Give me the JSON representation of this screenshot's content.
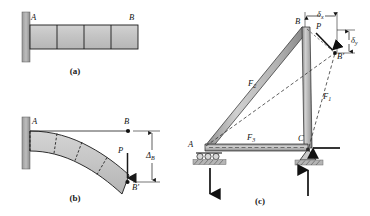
{
  "figure": {
    "panels": [
      {
        "id": "a",
        "caption": "(a)",
        "description": "undeformed-cantilever-beam",
        "labels": [
          {
            "key": "A",
            "text": "A"
          },
          {
            "key": "B",
            "text": "B"
          }
        ],
        "segments": 4,
        "wall": "fixed-support-hatched"
      },
      {
        "id": "b",
        "caption": "(b)",
        "description": "deflected-cantilever-beam",
        "labels": [
          {
            "key": "A",
            "text": "A"
          },
          {
            "key": "B",
            "text": "B"
          },
          {
            "key": "Bprime",
            "text": "B′"
          },
          {
            "key": "P",
            "text": "P"
          },
          {
            "key": "deltaB",
            "text": "Δ",
            "sub": "B"
          }
        ],
        "segments": 4
      },
      {
        "id": "c",
        "caption": "(c)",
        "description": "truss-displacement-diagram",
        "labels": [
          {
            "key": "A",
            "text": "A"
          },
          {
            "key": "B",
            "text": "B"
          },
          {
            "key": "C",
            "text": "C"
          },
          {
            "key": "Bprime",
            "text": "B′"
          },
          {
            "key": "P",
            "text": "P"
          },
          {
            "key": "F1",
            "text": "F",
            "sub": "1"
          },
          {
            "key": "F2",
            "text": "F",
            "sub": "2"
          },
          {
            "key": "F3",
            "text": "F",
            "sub": "3"
          },
          {
            "key": "deltax",
            "text": "δ",
            "sub": "x"
          },
          {
            "key": "deltay",
            "text": "δ",
            "sub": "y"
          }
        ],
        "supports": [
          {
            "at": "A",
            "type": "roller-support"
          },
          {
            "at": "C",
            "type": "pin-support"
          }
        ],
        "reactions": [
          {
            "at": "A",
            "direction": "down"
          },
          {
            "at": "C",
            "direction": "up"
          },
          {
            "at": "C",
            "direction": "left"
          }
        ]
      }
    ],
    "colors": {
      "member_fill": "#b0b0b0",
      "member_light": "#d6d6d6",
      "outline": "#1a1a1a",
      "beam_fill": "#c3c3c3",
      "wall_fill": "#a9a9a9",
      "dashed": "#3a3a3a"
    }
  }
}
